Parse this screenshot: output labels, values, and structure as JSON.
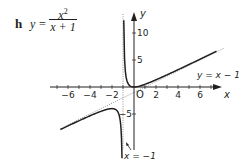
{
  "problem": {
    "label": "h",
    "equation_lhs": "y =",
    "numerator": "x",
    "numerator_exp": "2",
    "denominator": "x + 1"
  },
  "chart_data": {
    "type": "line",
    "xlabel": "x",
    "ylabel": "y",
    "origin_label": "O",
    "x_ticks": [
      -6,
      -4,
      -2,
      2,
      4,
      6
    ],
    "y_ticks": [
      10,
      5,
      -5
    ],
    "xlim": [
      -7,
      8
    ],
    "ylim": [
      -12,
      14
    ],
    "grid": false,
    "series": [
      {
        "name": "y = x^2/(x+1), left branch",
        "style": "solid",
        "x": [
          -6.7,
          -5,
          -4,
          -3,
          -2.5,
          -2,
          -1.6,
          -1.3,
          -1.15,
          -1.09
        ],
        "y": [
          -7.88,
          -6.25,
          -5.33,
          -4.5,
          -4.17,
          -4,
          -4.27,
          -5.63,
          -8.82,
          -13.2
        ]
      },
      {
        "name": "y = x^2/(x+1), right branch",
        "style": "solid",
        "x": [
          -0.93,
          -0.85,
          -0.7,
          -0.5,
          -0.25,
          0,
          1,
          2,
          4,
          6,
          7.5
        ],
        "y": [
          12.36,
          4.82,
          1.63,
          0.5,
          0.08,
          0,
          0.5,
          1.33,
          3.2,
          5.14,
          6.62
        ]
      }
    ],
    "asymptotes": [
      {
        "label": "y = x − 1",
        "type": "oblique",
        "style": "dotted"
      },
      {
        "label": "x = −1",
        "type": "vertical",
        "style": "dotted"
      }
    ],
    "annotations": [
      "y = x − 1",
      "x = −1"
    ]
  }
}
